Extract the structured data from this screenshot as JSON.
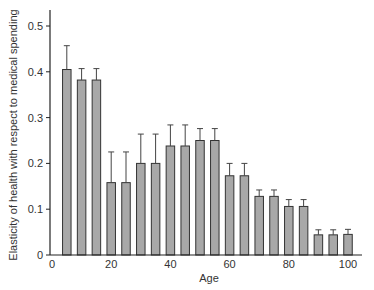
{
  "chart_data": {
    "type": "bar",
    "title": "",
    "xlabel": "Age",
    "ylabel": "Elasticity of health with respect to medical spending",
    "xlim": [
      0,
      105
    ],
    "ylim": [
      0,
      0.54
    ],
    "x_ticks": [
      0,
      20,
      40,
      60,
      80,
      100
    ],
    "x_tick_labels": [
      "0",
      "20",
      "40",
      "60",
      "80",
      "100"
    ],
    "y_ticks": [
      0,
      0.1,
      0.2,
      0.3,
      0.4,
      0.5
    ],
    "y_tick_labels": [
      "0",
      "0.1",
      "0.2",
      "0.3",
      "0.4",
      "0.5"
    ],
    "grid": false,
    "legend": null,
    "error_bars": "upper only",
    "bar_color": "#a8a8a8",
    "bar_edge_color": "#333333",
    "x": [
      5,
      10,
      15,
      20,
      25,
      30,
      35,
      40,
      45,
      50,
      55,
      60,
      65,
      70,
      75,
      80,
      85,
      90,
      95,
      100
    ],
    "values": [
      0.405,
      0.382,
      0.382,
      0.158,
      0.158,
      0.2,
      0.2,
      0.238,
      0.238,
      0.25,
      0.25,
      0.173,
      0.173,
      0.128,
      0.128,
      0.106,
      0.106,
      0.044,
      0.044,
      0.045
    ],
    "error_upper": [
      0.457,
      0.407,
      0.407,
      0.225,
      0.225,
      0.264,
      0.264,
      0.284,
      0.284,
      0.276,
      0.276,
      0.2,
      0.2,
      0.142,
      0.142,
      0.121,
      0.121,
      0.055,
      0.055,
      0.056
    ]
  }
}
